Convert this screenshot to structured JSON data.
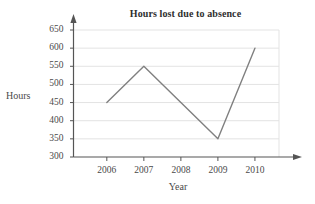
{
  "chart_data": {
    "type": "line",
    "title": "Hours lost due to absence",
    "xlabel": "Year",
    "ylabel": "Hours",
    "categories": [
      "2006",
      "2007",
      "2008",
      "2009",
      "2010"
    ],
    "x": [
      2006,
      2007,
      2008,
      2009,
      2010
    ],
    "values": [
      450,
      550,
      450,
      350,
      600
    ],
    "series": [
      {
        "name": "Hours lost",
        "values": [
          450,
          550,
          450,
          350,
          600
        ]
      }
    ],
    "ylim": [
      300,
      650
    ],
    "yticks": [
      300,
      350,
      400,
      450,
      500,
      550,
      600,
      650
    ],
    "ytick_labels": [
      "300",
      "350",
      "400",
      "450",
      "500",
      "550",
      "600",
      "650"
    ],
    "xtick_labels": [
      "2006",
      "2007",
      "2008",
      "2009",
      "2010"
    ],
    "grid": "horizontal",
    "legend": "none",
    "line_color": "#808080",
    "grid_color": "#e3e3e3",
    "axis_color": "#555555",
    "background": "#ffffff"
  }
}
